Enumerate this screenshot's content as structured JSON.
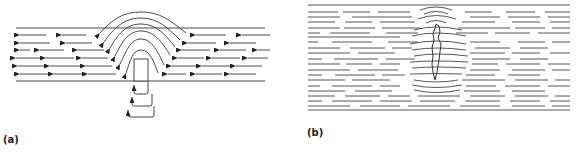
{
  "figure": {
    "panels": [
      {
        "label": "(a)",
        "description": "Flow lines (leftward arrows) in a channel deflected over a rectangular obstacle, with upward-curving J-shaped flow arrows beneath"
      },
      {
        "label": "(b)",
        "description": "Parallel horizontal dashed lines deflected around a narrow vertical elongated body"
      }
    ],
    "colors": {
      "line": "#333333",
      "background": "#ffffff"
    }
  }
}
